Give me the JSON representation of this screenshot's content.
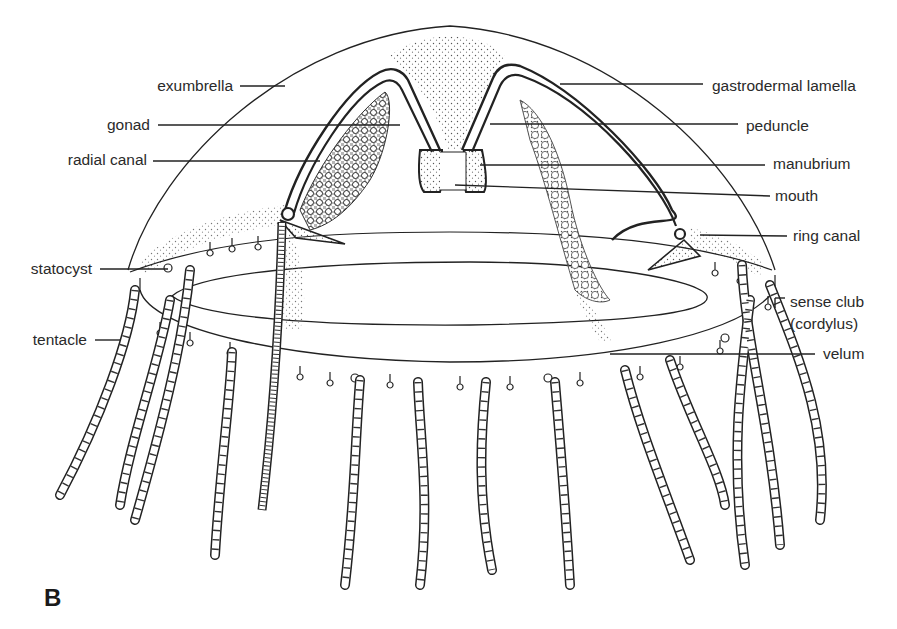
{
  "figure": {
    "panel_letter": "B",
    "labels_left": [
      {
        "text": "exumbrella",
        "x": 233,
        "y": 86
      },
      {
        "text": "gonad",
        "x": 147,
        "y": 125
      },
      {
        "text": "radial canal",
        "x": 139,
        "y": 160
      },
      {
        "text": "statocyst",
        "x": 90,
        "y": 269
      },
      {
        "text": "tentacle",
        "x": 83,
        "y": 339
      }
    ],
    "labels_right": [
      {
        "text": "gastrodermal lamella",
        "x": 712,
        "y": 86
      },
      {
        "text": "peduncle",
        "x": 746,
        "y": 126
      },
      {
        "text": "manubrium",
        "x": 773,
        "y": 164
      },
      {
        "text": "mouth",
        "x": 775,
        "y": 196
      },
      {
        "text": "ring canal",
        "x": 793,
        "y": 236
      },
      {
        "text": "sense club",
        "x": 790,
        "y": 302
      },
      {
        "text": "(cordylus)",
        "x": 790,
        "y": 324
      },
      {
        "text": "velum",
        "x": 823,
        "y": 354
      }
    ]
  }
}
